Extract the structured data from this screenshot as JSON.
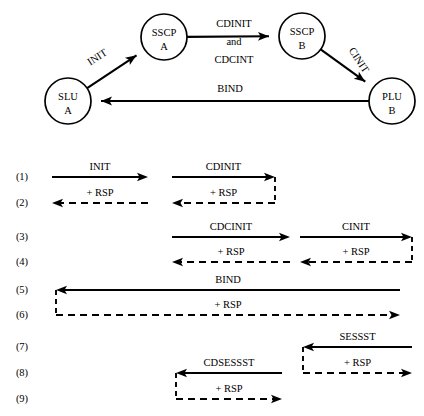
{
  "topology": {
    "nodes": [
      {
        "id": "slu-a",
        "line1": "SLU",
        "line2": "A",
        "cx": 68,
        "cy": 101,
        "r": 23
      },
      {
        "id": "sscp-a",
        "line1": "SSCP",
        "line2": "A",
        "cx": 164,
        "cy": 37,
        "r": 23
      },
      {
        "id": "sscp-b",
        "line1": "SSCP",
        "line2": "B",
        "cx": 302,
        "cy": 36,
        "r": 23
      },
      {
        "id": "plu-b",
        "line1": "PLU",
        "line2": "B",
        "cx": 392,
        "cy": 101,
        "r": 23
      }
    ],
    "edges": [
      {
        "id": "edge-init",
        "from": "slu-a",
        "to": "sscp-a",
        "label": "INIT",
        "rotated": true,
        "rotation": -33,
        "lx": 99,
        "ly": 60
      },
      {
        "id": "edge-cdinit",
        "from": "sscp-a",
        "to": "sscp-b",
        "label": "CDINIT",
        "rotated": false,
        "lx": 234,
        "ly": 27
      },
      {
        "id": "edge-and",
        "from": "sscp-a",
        "to": "sscp-b",
        "label": "and",
        "rotated": false,
        "lx": 234,
        "ly": 45
      },
      {
        "id": "edge-cdcint",
        "from": "sscp-a",
        "to": "sscp-b",
        "label": "CDCINT",
        "rotated": false,
        "lx": 234,
        "ly": 63
      },
      {
        "id": "edge-cinit",
        "from": "sscp-b",
        "to": "plu-b",
        "label": "CINIT",
        "rotated": true,
        "rotation": 57,
        "lx": 356,
        "ly": 62
      },
      {
        "id": "edge-bind",
        "from": "plu-b",
        "to": "slu-a",
        "label": "BIND",
        "rotated": false,
        "lx": 230,
        "ly": 92
      }
    ]
  },
  "sequence": {
    "rows": [
      {
        "num": "(1)",
        "label": "INIT",
        "kind": "request",
        "direction": "right",
        "y": 177,
        "x1": 52,
        "x2": 148
      },
      {
        "num": "(1)",
        "label": "CDINIT",
        "kind": "request",
        "direction": "right",
        "y": 177,
        "x1": 172,
        "x2": 275
      },
      {
        "num": "(2)",
        "label": "+ RSP",
        "kind": "response",
        "direction": "left",
        "y": 203,
        "x1": 52,
        "x2": 148
      },
      {
        "num": "(2)",
        "label": "+ RSP",
        "kind": "response",
        "direction": "left",
        "y": 203,
        "x1": 172,
        "x2": 275
      },
      {
        "num": "(3)",
        "label": "CDCINIT",
        "kind": "request",
        "direction": "right",
        "y": 237,
        "x1": 172,
        "x2": 290
      },
      {
        "num": "(3)",
        "label": "CINIT",
        "kind": "request",
        "direction": "right",
        "y": 237,
        "x1": 300,
        "x2": 412
      },
      {
        "num": "(4)",
        "label": "+ RSP",
        "kind": "response",
        "direction": "left",
        "y": 262,
        "x1": 172,
        "x2": 290
      },
      {
        "num": "(4)",
        "label": "+ RSP",
        "kind": "response",
        "direction": "left",
        "y": 262,
        "x1": 300,
        "x2": 412
      },
      {
        "num": "(5)",
        "label": "BIND",
        "kind": "request",
        "direction": "left",
        "y": 290,
        "x1": 56,
        "x2": 400
      },
      {
        "num": "(6)",
        "label": "+ RSP",
        "kind": "response",
        "direction": "right",
        "y": 315,
        "x1": 56,
        "x2": 400
      },
      {
        "num": "(7)",
        "label": "SESSST",
        "kind": "request",
        "direction": "left",
        "y": 347,
        "x1": 303,
        "x2": 412
      },
      {
        "num": "(8)",
        "label": "+ RSP",
        "kind": "response",
        "direction": "right",
        "y": 373,
        "x1": 303,
        "x2": 412
      },
      {
        "num": "(8)",
        "label": "CDSESSST",
        "kind": "request",
        "direction": "left",
        "y": 373,
        "x1": 176,
        "x2": 282
      },
      {
        "num": "(9)",
        "label": "+ RSP",
        "kind": "response",
        "direction": "right",
        "y": 399,
        "x1": 176,
        "x2": 282
      }
    ],
    "row_numbers": [
      {
        "text": "(1)",
        "y": 180
      },
      {
        "text": "(2)",
        "y": 206
      },
      {
        "text": "(3)",
        "y": 240
      },
      {
        "text": "(4)",
        "y": 265
      },
      {
        "text": "(5)",
        "y": 293
      },
      {
        "text": "(6)",
        "y": 318
      },
      {
        "text": "(7)",
        "y": 350
      },
      {
        "text": "(8)",
        "y": 376
      },
      {
        "text": "(9)",
        "y": 402
      }
    ],
    "row_number_x": 22,
    "connectors": [
      {
        "id": "connector-cdinit",
        "x": 275,
        "y1": 177,
        "y2": 203,
        "style": "dashed"
      },
      {
        "id": "connector-cinit",
        "x": 412,
        "y1": 237,
        "y2": 262,
        "style": "dashed"
      },
      {
        "id": "connector-bind",
        "x": 56,
        "y1": 290,
        "y2": 315,
        "style": "dashed"
      },
      {
        "id": "connector-sessst",
        "x": 303,
        "y1": 347,
        "y2": 373,
        "style": "dashed"
      },
      {
        "id": "connector-cdsessst",
        "x": 176,
        "y1": 373,
        "y2": 399,
        "style": "dashed"
      }
    ]
  },
  "colors": {
    "ink": "#000000",
    "paper": "#ffffff"
  }
}
